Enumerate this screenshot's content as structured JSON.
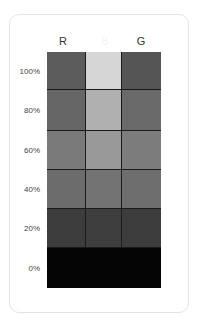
{
  "card": {
    "columns": [
      {
        "label": "R"
      },
      {
        "label": "B"
      },
      {
        "label": "G"
      }
    ],
    "rows": [
      {
        "label": "100%",
        "cells": [
          "#5c5c5c",
          "#d6d6d6",
          "#555555"
        ]
      },
      {
        "label": "80%",
        "cells": [
          "#666666",
          "#b0b0b0",
          "#6a6a6a"
        ]
      },
      {
        "label": "60%",
        "cells": [
          "#7a7a7a",
          "#999999",
          "#7c7c7c"
        ]
      },
      {
        "label": "40%",
        "cells": [
          "#6c6c6c",
          "#737373",
          "#6e6e6e"
        ]
      },
      {
        "label": "20%",
        "cells": [
          "#3c3c3c",
          "#3e3e3e",
          "#3c3c3c"
        ]
      },
      {
        "label": "0%",
        "cells": [
          "#050505",
          "#050505",
          "#050505"
        ]
      }
    ]
  },
  "colors": {
    "card_border": "#e4e4e4",
    "background": "#ffffff",
    "label_text": "#444444"
  }
}
